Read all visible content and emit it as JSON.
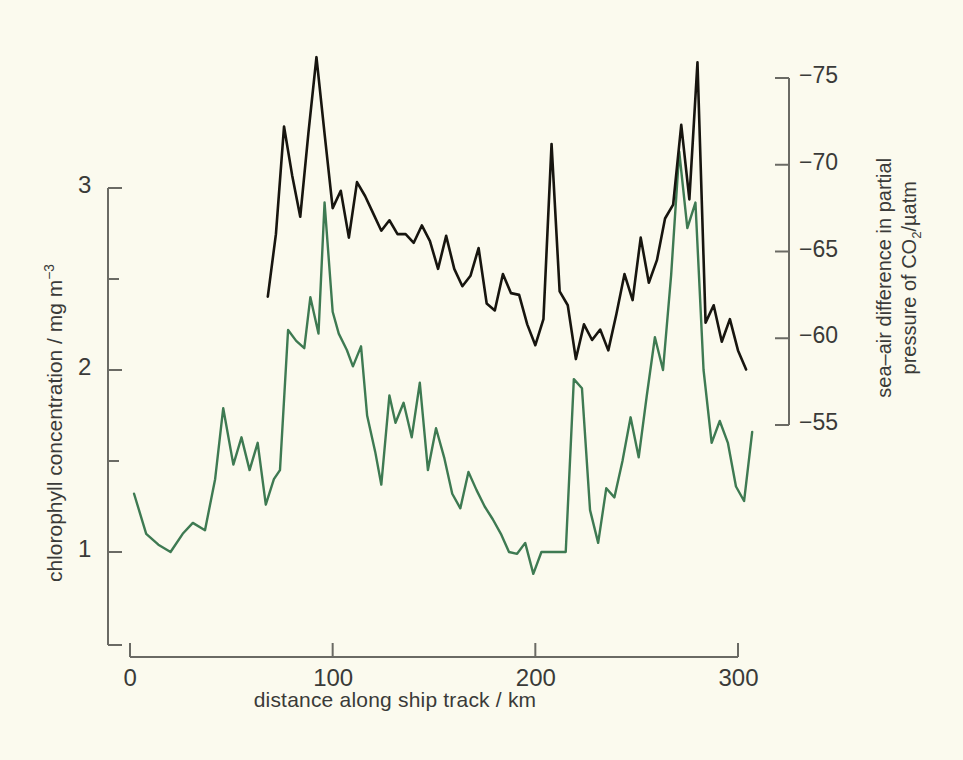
{
  "figure": {
    "background_color": "#fbfaee",
    "chlorophyll_color": "#3e7a52",
    "co2_color": "#17150f",
    "axis_color": "#6a6a64"
  },
  "axes": {
    "x": {
      "title": "distance along ship track / km",
      "ticks": [
        "0",
        "100",
        "200",
        "300"
      ],
      "tick_values": [
        0,
        100,
        200,
        300
      ],
      "range": [
        0,
        310
      ]
    },
    "y_left": {
      "title_line": "chlorophyll concentration / mg m",
      "title_exponent": "−3",
      "title_full": "chlorophyll concentration / mg m−3",
      "ticks": [
        "3",
        "2",
        "1"
      ],
      "tick_values": [
        3,
        2,
        1
      ],
      "minor_tick_values": [
        2.5,
        1.5
      ],
      "range": [
        0.55,
        3.1
      ]
    },
    "y_right": {
      "title_part1": "sea–air difference in partial",
      "title_part2": "pressure of CO",
      "title_sub": "2",
      "title_part3": "/µatm",
      "title_full": "sea–air difference in partial pressure of CO2 / µatm",
      "ticks": [
        "−75",
        "−70",
        "−65",
        "−60",
        "−55"
      ],
      "tick_values": [
        -75,
        -70,
        -65,
        -60,
        -55
      ],
      "range": [
        -76.3,
        -53.7
      ]
    }
  },
  "chart_data": {
    "type": "line",
    "title": "",
    "xlabel": "distance along ship track / km",
    "ylabel": "chlorophyll concentration / mg m-3",
    "y2label": "sea-air difference in partial pressure of CO2 / uatm",
    "xlim": [
      0,
      310
    ],
    "ylim": [
      0.55,
      3.1
    ],
    "y2lim": [
      -76.3,
      -53.7
    ],
    "grid": false,
    "legend": "none",
    "series": [
      {
        "name": "chlorophyll concentration",
        "axis": "left",
        "color": "#3e7a52",
        "x": [
          2,
          8,
          14,
          20,
          26,
          31,
          37,
          42,
          46,
          51,
          55,
          59,
          63,
          67,
          71,
          74,
          78,
          82,
          86,
          89,
          93,
          96,
          100,
          103,
          107,
          110,
          114,
          117,
          121,
          124,
          128,
          131,
          135,
          139,
          143,
          147,
          151,
          155,
          159,
          163,
          167,
          171,
          175,
          179,
          183,
          187,
          191,
          195,
          199,
          203,
          207,
          211,
          215,
          219,
          223,
          227,
          231,
          235,
          239,
          243,
          247,
          251,
          255,
          259,
          263,
          267,
          271,
          275,
          279,
          283,
          287,
          291,
          295,
          299,
          303,
          307
        ],
        "y": [
          1.32,
          1.1,
          1.04,
          1.0,
          1.1,
          1.16,
          1.12,
          1.4,
          1.79,
          1.48,
          1.63,
          1.45,
          1.6,
          1.26,
          1.4,
          1.45,
          2.22,
          2.16,
          2.12,
          2.4,
          2.2,
          2.92,
          2.32,
          2.2,
          2.11,
          2.02,
          2.13,
          1.75,
          1.55,
          1.37,
          1.86,
          1.71,
          1.82,
          1.63,
          1.93,
          1.45,
          1.68,
          1.52,
          1.32,
          1.24,
          1.44,
          1.34,
          1.25,
          1.18,
          1.1,
          1.0,
          0.99,
          1.05,
          0.88,
          1.0,
          1.0,
          1.0,
          1.0,
          1.95,
          1.9,
          1.23,
          1.05,
          1.35,
          1.3,
          1.5,
          1.74,
          1.52,
          1.86,
          2.18,
          2.0,
          2.52,
          3.2,
          2.78,
          2.92,
          2.0,
          1.6,
          1.72,
          1.6,
          1.36,
          1.28,
          1.66
        ]
      },
      {
        "name": "sea-air difference in partial pressure of CO2",
        "axis": "right",
        "color": "#17150f",
        "x": [
          68,
          72,
          76,
          80,
          84,
          88,
          92,
          96,
          100,
          104,
          108,
          112,
          116,
          120,
          124,
          128,
          132,
          136,
          140,
          144,
          148,
          152,
          156,
          160,
          164,
          168,
          172,
          176,
          180,
          184,
          188,
          192,
          196,
          200,
          204,
          208,
          212,
          216,
          220,
          224,
          228,
          232,
          236,
          240,
          244,
          248,
          252,
          256,
          260,
          264,
          268,
          272,
          276,
          280,
          284,
          288,
          292,
          296,
          300,
          304
        ],
        "y": [
          -62.4,
          -66.0,
          -72.2,
          -69.4,
          -67.0,
          -71.8,
          -76.2,
          -71.8,
          -67.5,
          -68.5,
          -65.8,
          -69.0,
          -68.2,
          -67.2,
          -66.2,
          -66.8,
          -66.0,
          -66.0,
          -65.5,
          -66.5,
          -65.6,
          -64.0,
          -65.9,
          -64.0,
          -63.0,
          -63.6,
          -65.2,
          -62.0,
          -61.6,
          -63.7,
          -62.6,
          -62.5,
          -60.8,
          -59.6,
          -61.1,
          -71.2,
          -62.7,
          -61.9,
          -58.8,
          -60.8,
          -59.9,
          -60.5,
          -59.3,
          -61.4,
          -63.7,
          -62.2,
          -65.8,
          -63.2,
          -64.5,
          -66.9,
          -67.7,
          -72.3,
          -68.0,
          -75.9,
          -60.9,
          -61.9,
          -59.8,
          -61.1,
          -59.3,
          -58.2
        ]
      }
    ]
  }
}
